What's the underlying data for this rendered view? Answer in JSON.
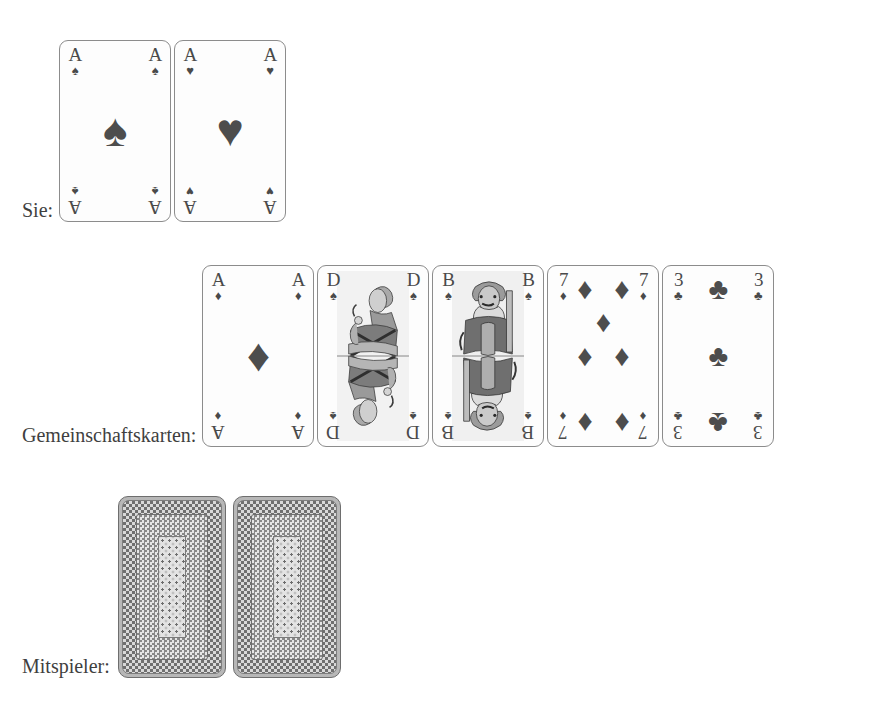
{
  "background_color": "#ffffff",
  "ink_color": "#3f3f3f",
  "pip_color": "#4d4d4d",
  "rows": [
    {
      "id": "player-hand",
      "label": "Sie:",
      "face_up": true,
      "cards": [
        {
          "rank": "A",
          "suit": "spades",
          "suit_glyph": "♠",
          "name": "ace-of-spades"
        },
        {
          "rank": "A",
          "suit": "hearts",
          "suit_glyph": "♥",
          "name": "ace-of-hearts"
        }
      ]
    },
    {
      "id": "community-cards",
      "label": "Gemeinschaftskarten:",
      "face_up": true,
      "cards": [
        {
          "rank": "A",
          "suit": "diamonds",
          "suit_glyph": "♦",
          "name": "ace-of-diamonds"
        },
        {
          "rank": "D",
          "suit": "spades",
          "suit_glyph": "♠",
          "name": "queen-of-spades"
        },
        {
          "rank": "B",
          "suit": "spades",
          "suit_glyph": "♠",
          "name": "jack-of-spades"
        },
        {
          "rank": "7",
          "suit": "diamonds",
          "suit_glyph": "♦",
          "name": "seven-of-diamonds"
        },
        {
          "rank": "3",
          "suit": "clubs",
          "suit_glyph": "♣",
          "name": "three-of-clubs"
        }
      ]
    },
    {
      "id": "opponent-hand",
      "label": "Mitspieler:",
      "face_up": false,
      "cards": [
        {
          "rank": "",
          "suit": "back",
          "suit_glyph": "",
          "name": "face-down-card"
        },
        {
          "rank": "",
          "suit": "back",
          "suit_glyph": "",
          "name": "face-down-card"
        }
      ]
    }
  ],
  "labels": {
    "player": "Sie:",
    "community": "Gemeinschaftskarten:",
    "opponent": "Mitspieler:"
  }
}
